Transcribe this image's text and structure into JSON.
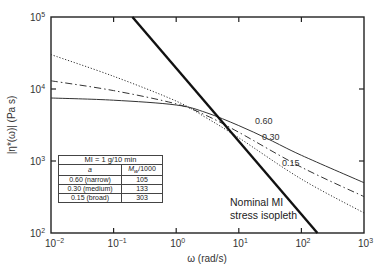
{
  "chart_data": {
    "type": "line",
    "title": "",
    "xlabel": "ω (rad/s)",
    "ylabel": "|η*(ω)| (Pa s)",
    "xscale": "log",
    "yscale": "log",
    "xlim": [
      0.01,
      1000
    ],
    "ylim": [
      100,
      100000
    ],
    "grid": false,
    "x_ticks": [
      {
        "base": "10",
        "exp": "−2"
      },
      {
        "base": "10",
        "exp": "−1"
      },
      {
        "base": "10",
        "exp": "0"
      },
      {
        "base": "10",
        "exp": "1"
      },
      {
        "base": "10",
        "exp": "2"
      },
      {
        "base": "10",
        "exp": "3"
      }
    ],
    "y_ticks": [
      {
        "base": "10",
        "exp": "2"
      },
      {
        "base": "10",
        "exp": "3"
      },
      {
        "base": "10",
        "exp": "4"
      },
      {
        "base": "10",
        "exp": "5"
      }
    ],
    "series": [
      {
        "name": "0.60",
        "label": "0.60",
        "style": "solid",
        "x": [
          0.01,
          0.1,
          1,
          3,
          10,
          30,
          100,
          1000
        ],
        "y": [
          7500,
          7000,
          6000,
          4700,
          3100,
          2000,
          1200,
          500
        ]
      },
      {
        "name": "0.30",
        "label": "0.30",
        "style": "dashdot",
        "x": [
          0.01,
          0.1,
          1,
          3,
          10,
          100,
          1000
        ],
        "y": [
          13000,
          9500,
          6200,
          4300,
          2500,
          820,
          320
        ]
      },
      {
        "name": "0.15",
        "label": "0.15",
        "style": "dotted",
        "x": [
          0.01,
          0.1,
          1,
          3,
          10,
          100,
          1000
        ],
        "y": [
          30000,
          15000,
          6800,
          4000,
          2100,
          560,
          190
        ]
      },
      {
        "name": "Nominal MI stress isopleth",
        "style": "thick-solid",
        "x": [
          0.2,
          180
        ],
        "y": [
          100000,
          100
        ]
      }
    ],
    "annotations": [
      {
        "text": "Nominal MI",
        "line": 1
      },
      {
        "text": "stress isopleth",
        "line": 2
      }
    ],
    "legend_table": {
      "title": "MI = 1 g/10 min",
      "headers": [
        "a",
        "Mw/1000"
      ],
      "header_sub": "w",
      "rows": [
        [
          "0.60 (narrow)",
          "105"
        ],
        [
          "0.30 (medium)",
          "133"
        ],
        [
          "0.15 (broad)",
          "303"
        ]
      ]
    }
  }
}
